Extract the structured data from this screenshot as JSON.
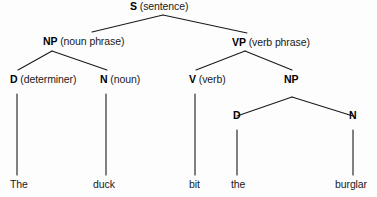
{
  "diagram": {
    "type": "constituency-parse-tree",
    "background_color": "#fdfdfd",
    "line_color": "#1a1a1a",
    "text_color": "#1a1a1a"
  },
  "nodes": {
    "s": {
      "cat": "S",
      "gloss": "(sentence)"
    },
    "np_subject": {
      "cat": "NP",
      "gloss": "(noun phrase)"
    },
    "vp": {
      "cat": "VP",
      "gloss": "(verb phrase)"
    },
    "d_subject": {
      "cat": "D",
      "gloss": "(determiner)"
    },
    "n_subject": {
      "cat": "N",
      "gloss": "(noun)"
    },
    "v": {
      "cat": "V",
      "gloss": "(verb)"
    },
    "np_object": {
      "cat": "NP",
      "gloss": ""
    },
    "d_object": {
      "cat": "D",
      "gloss": ""
    },
    "n_object": {
      "cat": "N",
      "gloss": ""
    }
  },
  "leaves": {
    "the_subject": "The",
    "duck": "duck",
    "bit": "bit",
    "the_object": "the",
    "burglar": "burglar"
  },
  "sentence": "The duck bit the burglar"
}
